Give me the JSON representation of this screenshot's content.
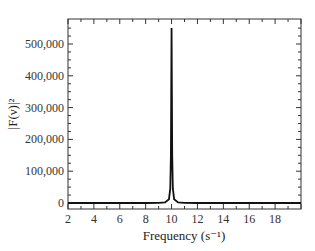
{
  "chart_data": {
    "type": "line",
    "title": "",
    "xlabel": "Frequency (s⁻¹)",
    "ylabel": "|F(ν)|²",
    "xlim": [
      2,
      20
    ],
    "ylim": [
      -20000,
      570000
    ],
    "xticks": [
      2,
      4,
      6,
      8,
      10,
      12,
      14,
      16,
      18
    ],
    "xtick_labels": [
      "2",
      "4",
      "6",
      "8",
      "10",
      "12",
      "14",
      "16",
      "18"
    ],
    "yticks": [
      0,
      100000,
      200000,
      300000,
      400000,
      500000
    ],
    "ytick_labels": [
      "0",
      "100,000",
      "200,000",
      "300,000",
      "400,000",
      "500,000"
    ],
    "grid": false,
    "legend": null,
    "series": [
      {
        "name": "power spectrum",
        "color": "#111111",
        "x": [
          2,
          8,
          9,
          9.5,
          9.8,
          9.9,
          9.95,
          10.0,
          10.05,
          10.1,
          10.2,
          10.5,
          11,
          12,
          20
        ],
        "values": [
          0,
          0,
          500,
          2000,
          12000,
          45000,
          150000,
          550000,
          150000,
          45000,
          12000,
          2000,
          500,
          0,
          0
        ]
      }
    ],
    "peak": {
      "x": 10,
      "y": 550000
    }
  }
}
